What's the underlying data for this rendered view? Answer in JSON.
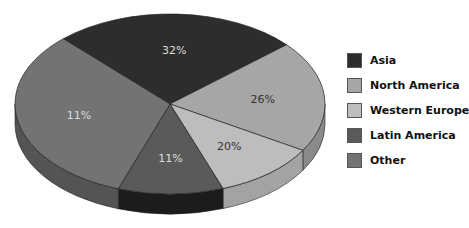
{
  "chart_data": {
    "type": "pie",
    "title": "",
    "style": "3d-exploded-ellipse",
    "categories": [
      "Asia",
      "North America",
      "Western Europe",
      "Latin America",
      "Other"
    ],
    "values": [
      32,
      26,
      20,
      11,
      11
    ],
    "labels": [
      "32%",
      "26%",
      "20%",
      "11%",
      "11%"
    ],
    "colors": [
      "#2d2d2d",
      "#a6a6a6",
      "#bdbdbd",
      "#5a5a5a",
      "#737373"
    ],
    "side_colors": [
      "#141414",
      "#8a8a8a",
      "#a3a3a3",
      "#1c1c1c",
      "#545454"
    ],
    "label_colors": [
      "#dcdcdc",
      "#333333",
      "#333333",
      "#dcdcdc",
      "#dcdcdc"
    ],
    "boundary_angles_deg": [
      -133.5,
      -41.2,
      31,
      70,
      109.5,
      226.5
    ],
    "legend_position": "right"
  },
  "legend": {
    "items": [
      {
        "label": "Asia",
        "color": "#2d2d2d"
      },
      {
        "label": "North America",
        "color": "#a6a6a6"
      },
      {
        "label": "Western Europe",
        "color": "#bdbdbd"
      },
      {
        "label": "Latin America",
        "color": "#5a5a5a"
      },
      {
        "label": "Other",
        "color": "#737373"
      }
    ]
  }
}
